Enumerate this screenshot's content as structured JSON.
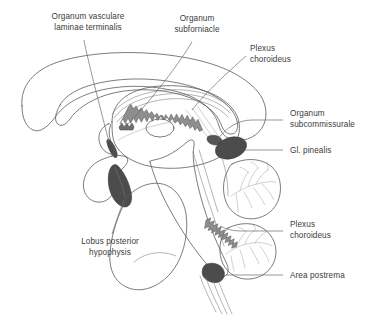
{
  "figure": {
    "background_color": "#ffffff",
    "label_color": "#3b3b3b",
    "leader_color": "#6b6b6b"
  },
  "palette": {
    "cerebrum_light": "#e9e9e9",
    "cerebrum_mid": "#dcdcdc",
    "thalamus_gray": "#b9b9b9",
    "thalamus_light_oval": "#efefef",
    "brainstem_gray": "#c6c6c6",
    "pons_light": "#eeeeee",
    "cerebellum_light": "#f2f2f2",
    "dark_organ": "#4c4c4c",
    "plexus_band": "#8e8e8e",
    "outline": "#5a5a5a"
  },
  "labels": [
    {
      "id": "organum-vasculare-laminae-terminalis",
      "lines": [
        "Organum vasculare",
        "laminae terminalis"
      ],
      "align": "middle",
      "x": 88,
      "y": 18
    },
    {
      "id": "organum-subfornicale",
      "lines": [
        "Organum",
        "subforniacle"
      ],
      "align": "middle",
      "x": 197,
      "y": 20
    },
    {
      "id": "plexus-choroideus-upper",
      "lines": [
        "Plexus",
        "choroideus"
      ],
      "align": "start",
      "x": 250,
      "y": 50
    },
    {
      "id": "organum-subcommissurale",
      "lines": [
        "Organum",
        "subcommissurale"
      ],
      "align": "start",
      "x": 285,
      "y": 115
    },
    {
      "id": "gl-pinealis",
      "lines": [
        "Gl. pinealis"
      ],
      "align": "start",
      "x": 285,
      "y": 153
    },
    {
      "id": "plexus-choroideus-lower",
      "lines": [
        "Plexus",
        "choroideus"
      ],
      "align": "start",
      "x": 285,
      "y": 226
    },
    {
      "id": "area-postrema",
      "lines": [
        "Area postrema"
      ],
      "align": "start",
      "x": 285,
      "y": 272
    },
    {
      "id": "lobus-posterior-hypophysis",
      "lines": [
        "Lobus posterior",
        "hypophysis"
      ],
      "align": "middle",
      "x": 110,
      "y": 243
    }
  ],
  "label_text": {
    "ovlt_line1": "Organum vasculare",
    "ovlt_line2": "laminae terminalis",
    "subfornicale_line1": "Organum",
    "subfornicale_line2": "subforniacle",
    "plexus_upper_line1": "Plexus",
    "plexus_upper_line2": "choroideus",
    "subcommissurale_line1": "Organum",
    "subcommissurale_line2": "subcommissurale",
    "pinealis_line1": "Gl. pinealis",
    "plexus_lower_line1": "Plexus",
    "plexus_lower_line2": "choroideus",
    "area_postrema_line1": "Area postrema",
    "hypophysis_line1": "Lobus posterior",
    "hypophysis_line2": "hypophysis"
  },
  "structures": [
    {
      "id": "corpus-callosum",
      "name": "corpus callosum",
      "fill": "#e9e9e9"
    },
    {
      "id": "fornix",
      "name": "fornix",
      "fill": "#dcdcdc"
    },
    {
      "id": "thalamus",
      "name": "thalamus",
      "fill": "#b9b9b9"
    },
    {
      "id": "interthalamic-adhesion",
      "name": "interthalamic adhesion",
      "fill": "#efefef"
    },
    {
      "id": "choroid-plexus-third-ventricle",
      "name": "choroid plexus of third ventricle",
      "fill": "#8e8e8e"
    },
    {
      "id": "pineal-gland",
      "name": "pineal gland",
      "fill": "#4c4c4c"
    },
    {
      "id": "posterior-pituitary",
      "name": "posterior lobe of hypophysis",
      "fill": "#4c4c4c"
    },
    {
      "id": "area-postrema-organ",
      "name": "area postrema",
      "fill": "#4c4c4c"
    },
    {
      "id": "brainstem",
      "name": "brainstem",
      "fill": "#c6c6c6"
    },
    {
      "id": "pons-medulla",
      "name": "pons and medulla",
      "fill": "#eeeeee"
    },
    {
      "id": "cerebellum",
      "name": "cerebellum",
      "fill": "#f2f2f2"
    },
    {
      "id": "choroid-plexus-fourth-ventricle",
      "name": "choroid plexus of fourth ventricle",
      "fill": "#8e8e8e"
    }
  ]
}
